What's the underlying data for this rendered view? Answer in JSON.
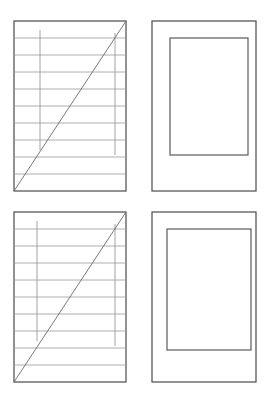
{
  "figure": {
    "canvas": {
      "width": 269,
      "height": 395,
      "background": "#ffffff"
    },
    "colors": {
      "frame_stroke": "#4a4a4a",
      "rule_stroke": "#9a9a9a",
      "column_stroke": "#8d8d8d",
      "diagonal_stroke": "#6a6a6a",
      "inner_rect_stroke": "#5a5a5a",
      "fill": "#ffffff"
    },
    "stroke_widths": {
      "frame": 1.2,
      "rule": 0.8,
      "column": 0.8,
      "diagonal": 0.9,
      "inner_rect": 1.2
    },
    "panels": [
      {
        "id": "panel-top-left",
        "name": "ruled-diagonal-panel-top-left",
        "kind": "ruled-grid",
        "frame": {
          "x": 14,
          "y": 21,
          "width": 112,
          "height": 170
        },
        "horizontal_rules_y": [
          38,
          55,
          72,
          89,
          106,
          123,
          140,
          157,
          174
        ],
        "vertical_columns": [
          {
            "x": 40,
            "y1": 30,
            "y2": 150
          },
          {
            "x": 115,
            "y1": 33,
            "y2": 155
          }
        ],
        "diagonal": {
          "x1": 14,
          "y1": 191,
          "x2": 126,
          "y2": 21
        }
      },
      {
        "id": "panel-top-right",
        "name": "nested-rect-panel-top-right",
        "kind": "nested-rect",
        "frame": {
          "x": 152,
          "y": 21,
          "width": 104,
          "height": 170
        },
        "inner_rect": {
          "x": 170,
          "y": 38,
          "width": 78,
          "height": 117
        }
      },
      {
        "id": "panel-bottom-left",
        "name": "ruled-diagonal-panel-bottom-left",
        "kind": "ruled-grid",
        "frame": {
          "x": 14,
          "y": 212,
          "width": 112,
          "height": 170
        },
        "horizontal_rules_y": [
          229,
          246,
          263,
          280,
          297,
          314,
          331,
          348,
          365
        ],
        "vertical_columns": [
          {
            "x": 37,
            "y1": 221,
            "y2": 341
          },
          {
            "x": 115,
            "y1": 224,
            "y2": 346
          }
        ],
        "diagonal": {
          "x1": 14,
          "y1": 382,
          "x2": 126,
          "y2": 212
        }
      },
      {
        "id": "panel-bottom-right",
        "name": "nested-rect-panel-bottom-right",
        "kind": "nested-rect",
        "frame": {
          "x": 152,
          "y": 212,
          "width": 104,
          "height": 170
        },
        "inner_rect": {
          "x": 167,
          "y": 229,
          "width": 84,
          "height": 121
        }
      }
    ]
  }
}
